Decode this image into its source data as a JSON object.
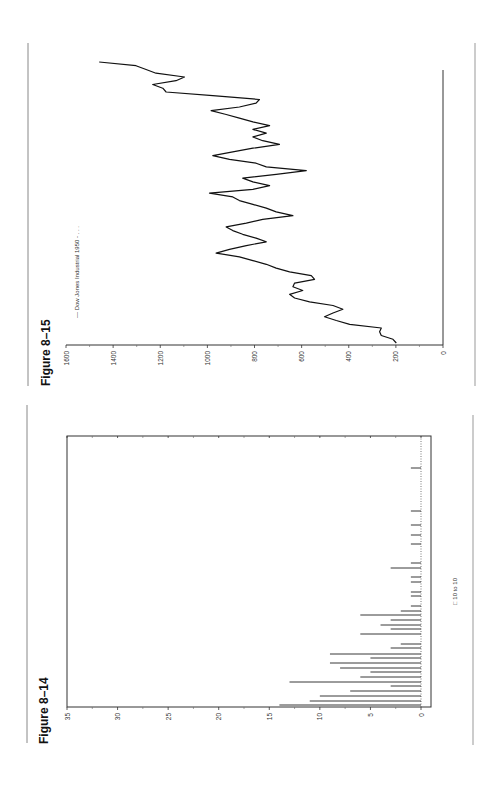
{
  "page": {
    "figures": [
      "Figure 8–15",
      "Figure 8–14"
    ]
  },
  "fig15": {
    "title": "Figure 8–15",
    "legend": "— Dow Jones Industrial 1950 - . . .",
    "ticks": [
      "0",
      "200",
      "400",
      "600",
      "800",
      "1000",
      "1200",
      "1400",
      "1600"
    ]
  },
  "fig14": {
    "title": "Figure 8–14",
    "legend": "□ 10 to 10",
    "ticks": [
      "0",
      "5",
      "10",
      "15",
      "20",
      "25",
      "30",
      "35"
    ]
  },
  "chart_data": [
    {
      "type": "line",
      "title": "Figure 8–15",
      "legend": [
        "Dow Jones Industrial 1950 - ..."
      ],
      "ylabel": "",
      "xlabel": "",
      "ylim": [
        0,
        1600
      ],
      "yticks": [
        0,
        200,
        400,
        600,
        800,
        1000,
        1200,
        1400,
        1600
      ],
      "grid": false,
      "legend_position": "top",
      "orientation": "rotated 90° counter-clockwise on page",
      "series": [
        {
          "name": "Dow Jones Industrial 1950 - ...",
          "values": [
            198,
            212,
            262,
            269,
            262,
            396,
            453,
            503,
            467,
            425,
            467,
            566,
            630,
            651,
            595,
            637,
            630,
            545,
            559,
            651,
            708,
            750,
            807,
            864,
            963,
            906,
            835,
            750,
            793,
            850,
            892,
            920,
            835,
            765,
            637,
            708,
            750,
            807,
            864,
            892,
            991,
            807,
            736,
            807,
            850,
            708,
            580,
            750,
            793,
            906,
            977,
            892,
            807,
            694,
            765,
            807,
            750,
            807,
            736,
            807,
            864,
            920,
            984,
            864,
            793,
            779,
            977,
            1175,
            1189,
            1232,
            1133,
            1097,
            1218,
            1260,
            1303,
            1459
          ]
        }
      ]
    },
    {
      "type": "bar",
      "title": "Figure 8–14",
      "legend": [
        "10 to 10"
      ],
      "xlabel": "",
      "ylabel": "",
      "ylim": [
        0,
        35
      ],
      "yticks": [
        0,
        5,
        10,
        15,
        20,
        25,
        30,
        35
      ],
      "grid": false,
      "legend_position": "bottom",
      "orientation": "rotated 90° counter-clockwise on page",
      "categories": [
        1,
        2,
        3,
        4,
        5,
        6,
        7,
        8,
        9,
        10,
        11,
        12,
        13,
        14,
        15,
        16,
        17,
        18,
        19,
        20,
        21,
        22,
        23,
        24,
        25,
        26,
        27,
        28,
        29,
        30,
        31,
        32
      ],
      "values": [
        14,
        11,
        10,
        7,
        3,
        13,
        6,
        5,
        8,
        9,
        5,
        9,
        3,
        2,
        6,
        3,
        4,
        3,
        6,
        2,
        1,
        1,
        1,
        1,
        1,
        3,
        1,
        1,
        1,
        1,
        1,
        1
      ]
    }
  ]
}
